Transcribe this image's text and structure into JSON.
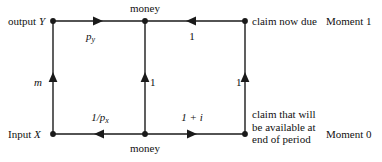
{
  "diagram": {
    "nodes": {
      "top_left": {
        "label": "output Y",
        "x": 53,
        "y": 21
      },
      "top_center": {
        "label": "money",
        "x": 145,
        "y": 21
      },
      "top_right": {
        "label": "claim now due",
        "x": 245,
        "y": 21
      },
      "bottom_left": {
        "label": "Input X",
        "x": 53,
        "y": 134
      },
      "bottom_center": {
        "label": "money",
        "x": 145,
        "y": 134
      },
      "bottom_right": {
        "label": "claim that will be available at end of period",
        "x": 245,
        "y": 134
      }
    },
    "edge_labels": {
      "top_left_segment": "p",
      "top_left_segment_sub": "y",
      "top_right_segment": "1",
      "bottom_left_segment_num": "1/p",
      "bottom_left_segment_sub": "x",
      "bottom_right_segment": "1 + i",
      "left_vertical": "m",
      "middle_vertical": "1",
      "right_vertical": "1"
    },
    "side_labels": {
      "output_y_prefix": "output",
      "output_y_symbol": "Y",
      "input_x_prefix": "Input",
      "input_x_symbol": "X",
      "claim_now_due": "claim now due",
      "claim_future_line1": "claim that will",
      "claim_future_line2": "be available at",
      "claim_future_line3": "end of period",
      "moment_1": "Moment 1",
      "moment_0": "Moment 0",
      "money_top": "money",
      "money_bottom": "money"
    },
    "colors": {
      "line": "#1a1a1a",
      "text": "#111111",
      "background": "#ffffff"
    }
  }
}
